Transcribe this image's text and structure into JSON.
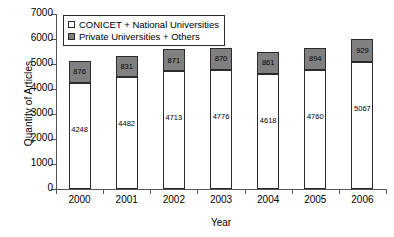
{
  "chart_data": {
    "type": "bar",
    "subtype": "stacked-vertical",
    "title": "",
    "xlabel": "Year",
    "ylabel": "Quantity of Articles",
    "categories": [
      "2000",
      "2001",
      "2002",
      "2003",
      "2004",
      "2005",
      "2006"
    ],
    "series": [
      {
        "name": "CONICET + National Universities",
        "color": "#ffffff",
        "values": [
          4248,
          4482,
          4713,
          4776,
          4618,
          4760,
          5067
        ]
      },
      {
        "name": "Private Universities + Others",
        "color": "#808080",
        "values": [
          876,
          831,
          871,
          870,
          861,
          894,
          929
        ]
      }
    ],
    "totals": [
      5124,
      5313,
      5584,
      5646,
      5479,
      5654,
      5996
    ],
    "ylim": [
      0,
      7000
    ],
    "yticks": [
      0,
      1000,
      2000,
      3000,
      4000,
      5000,
      6000,
      7000
    ],
    "ytick_labels": [
      "0",
      "1000",
      "2000",
      "3000",
      "4000",
      "5000",
      "6000",
      "7000"
    ],
    "grid": false,
    "legend_position": "top-left",
    "bar_labels_shown": true
  },
  "legend": {
    "items": [
      {
        "label": "CONICET + National Universities",
        "swatch": "white-square-icon"
      },
      {
        "label": "Private Universities + Others",
        "swatch": "gray-square-icon"
      }
    ]
  },
  "axes": {
    "y_title": "Quantity of Articles",
    "x_title": "Year"
  }
}
